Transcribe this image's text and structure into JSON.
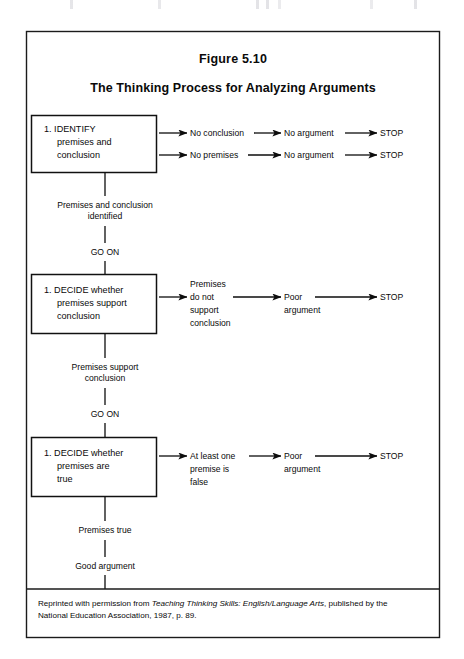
{
  "figure": {
    "number_label": "Figure 5.10",
    "title": "The Thinking Process for Analyzing Arguments"
  },
  "steps": [
    {
      "id": "identify",
      "box_lines": [
        "1.  IDENTIFY",
        "premises and",
        "conclusion"
      ],
      "branches": [
        {
          "nodes": [
            "No conclusion",
            "No argument",
            "STOP"
          ]
        },
        {
          "nodes": [
            "No premises",
            "No argument",
            "STOP"
          ]
        }
      ],
      "outcome_lines": [
        "Premises and conclusion",
        "identified"
      ],
      "continue_label": "GO ON"
    },
    {
      "id": "decide-support",
      "box_lines": [
        "1.  DECIDE whether",
        "premises  support",
        "conclusion"
      ],
      "branches": [
        {
          "nodes": [
            "Premises\ndo not\nsupport\nconclusion",
            "Poor\nargument",
            "STOP"
          ]
        }
      ],
      "branch_stacks": [
        [
          "Premises",
          "do not",
          "support",
          "conclusion"
        ],
        [
          "Poor",
          "argument"
        ],
        [
          "STOP"
        ]
      ],
      "outcome_lines": [
        "Premises  support",
        "conclusion"
      ],
      "continue_label": "GO ON"
    },
    {
      "id": "decide-true",
      "box_lines": [
        "1.  DECIDE whether",
        "premises  are",
        "true"
      ],
      "branch_stacks": [
        [
          "At least one",
          "premise is",
          "false"
        ],
        [
          "Poor",
          "argument"
        ],
        [
          "STOP"
        ]
      ],
      "outcome_lines": [
        "Premises true"
      ],
      "final_label": "Good argument"
    }
  ],
  "credit": {
    "line1_prefix": "Reprinted with permission from ",
    "line1_italic": "Teaching Thinking Skills: English/Language Arts",
    "line1_suffix": ", published by the",
    "line2": "National Education Association, 1987, p. 89."
  },
  "colors": {
    "ink": "#0a0a0a",
    "rule": "#1b1b1b",
    "paper": "#ffffff"
  }
}
